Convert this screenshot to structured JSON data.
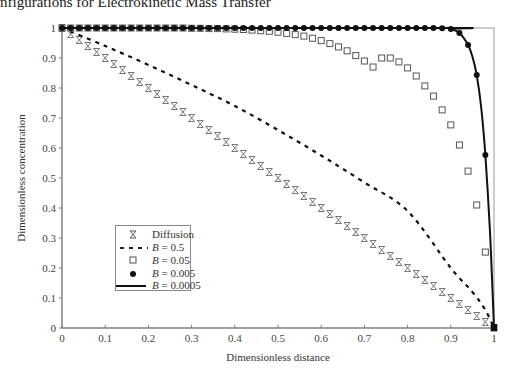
{
  "page_header": "nfigurations for Electrokinetic Mass Transfer",
  "chart_data": {
    "type": "scatter",
    "title": "",
    "xlabel": "Dimensionless distance",
    "ylabel": "Dimensionless concentration",
    "xlim": [
      0,
      1
    ],
    "ylim": [
      0,
      1
    ],
    "x_ticks": [
      "0",
      "0.1",
      "0.2",
      "0.3",
      "0.4",
      "0.5",
      "0.6",
      "0.7",
      "0.8",
      "0.9",
      "1"
    ],
    "y_ticks": [
      "0",
      "0.1",
      "0.2",
      "0.3",
      "0.4",
      "0.5",
      "0.6",
      "0.7",
      "0.8",
      "0.9",
      "1"
    ],
    "grid": false,
    "legend_position": "lower-left inside",
    "series": [
      {
        "name": "Diffusion",
        "marker": "asterisk",
        "x": [
          0.0,
          0.02,
          0.04,
          0.06,
          0.08,
          0.1,
          0.12,
          0.14,
          0.16,
          0.18,
          0.2,
          0.22,
          0.24,
          0.26,
          0.28,
          0.3,
          0.32,
          0.34,
          0.36,
          0.38,
          0.4,
          0.42,
          0.44,
          0.46,
          0.48,
          0.5,
          0.52,
          0.54,
          0.56,
          0.58,
          0.6,
          0.62,
          0.64,
          0.66,
          0.68,
          0.7,
          0.72,
          0.74,
          0.76,
          0.78,
          0.8,
          0.82,
          0.84,
          0.86,
          0.88,
          0.9,
          0.92,
          0.94,
          0.96,
          0.98
        ],
        "y": [
          1.0,
          0.98,
          0.96,
          0.94,
          0.92,
          0.9,
          0.88,
          0.86,
          0.84,
          0.82,
          0.8,
          0.78,
          0.76,
          0.74,
          0.72,
          0.7,
          0.68,
          0.66,
          0.64,
          0.62,
          0.6,
          0.58,
          0.56,
          0.54,
          0.52,
          0.5,
          0.48,
          0.46,
          0.44,
          0.42,
          0.4,
          0.38,
          0.36,
          0.34,
          0.32,
          0.3,
          0.28,
          0.26,
          0.24,
          0.22,
          0.2,
          0.18,
          0.16,
          0.14,
          0.12,
          0.1,
          0.08,
          0.06,
          0.04,
          0.02
        ]
      },
      {
        "name": "B = 0.5",
        "marker": "dashed-line",
        "x": [
          0.0,
          0.1,
          0.2,
          0.3,
          0.4,
          0.5,
          0.6,
          0.7,
          0.8,
          0.9,
          0.95,
          0.98,
          1.0
        ],
        "y": [
          1.0,
          0.94,
          0.877,
          0.81,
          0.74,
          0.66,
          0.575,
          0.485,
          0.39,
          0.2,
          0.12,
          0.06,
          0.0
        ]
      },
      {
        "name": "B = 0.05",
        "marker": "open-square",
        "x": [
          0.0,
          0.02,
          0.04,
          0.06,
          0.08,
          0.1,
          0.12,
          0.14,
          0.16,
          0.18,
          0.2,
          0.22,
          0.24,
          0.26,
          0.28,
          0.3,
          0.32,
          0.34,
          0.36,
          0.38,
          0.4,
          0.42,
          0.44,
          0.46,
          0.48,
          0.5,
          0.52,
          0.54,
          0.56,
          0.58,
          0.6,
          0.62,
          0.64,
          0.66,
          0.68,
          0.7,
          0.72,
          0.74,
          0.76,
          0.78,
          0.8,
          0.82,
          0.84,
          0.86,
          0.88,
          0.9,
          0.92,
          0.94,
          0.96,
          0.98,
          1.0
        ],
        "y": [
          1.0,
          1.0,
          1.0,
          1.0,
          1.0,
          1.0,
          1.0,
          1.0,
          1.0,
          1.0,
          1.0,
          1.0,
          1.0,
          1.0,
          1.0,
          0.999,
          0.999,
          0.998,
          0.998,
          0.997,
          0.996,
          0.995,
          0.993,
          0.991,
          0.989,
          0.986,
          0.982,
          0.978,
          0.973,
          0.966,
          0.958,
          0.948,
          0.937,
          0.924,
          0.908,
          0.89,
          0.87,
          0.9,
          0.9,
          0.887,
          0.867,
          0.84,
          0.807,
          0.773,
          0.727,
          0.677,
          0.61,
          0.523,
          0.41,
          0.253,
          0.0
        ]
      },
      {
        "name": "B = 0.005",
        "marker": "filled-circle",
        "x": [
          0.0,
          0.02,
          0.04,
          0.06,
          0.08,
          0.1,
          0.12,
          0.14,
          0.16,
          0.18,
          0.2,
          0.22,
          0.24,
          0.26,
          0.28,
          0.3,
          0.32,
          0.34,
          0.36,
          0.38,
          0.4,
          0.42,
          0.44,
          0.46,
          0.48,
          0.5,
          0.52,
          0.54,
          0.56,
          0.58,
          0.6,
          0.62,
          0.64,
          0.66,
          0.68,
          0.7,
          0.72,
          0.74,
          0.76,
          0.78,
          0.8,
          0.82,
          0.84,
          0.86,
          0.88,
          0.9,
          0.92,
          0.94,
          0.96,
          0.98,
          1.0
        ],
        "y": [
          1.0,
          1.0,
          1.0,
          1.0,
          1.0,
          1.0,
          1.0,
          1.0,
          1.0,
          1.0,
          1.0,
          1.0,
          1.0,
          1.0,
          1.0,
          1.0,
          1.0,
          1.0,
          1.0,
          1.0,
          1.0,
          1.0,
          1.0,
          1.0,
          1.0,
          1.0,
          1.0,
          1.0,
          1.0,
          1.0,
          1.0,
          1.0,
          1.0,
          1.0,
          1.0,
          1.0,
          1.0,
          1.0,
          1.0,
          1.0,
          1.0,
          1.0,
          1.0,
          1.0,
          0.999,
          0.997,
          0.983,
          0.943,
          0.843,
          0.577,
          0.0
        ]
      },
      {
        "name": "B = 0.0005",
        "marker": "solid-line",
        "x": [
          0.0,
          0.88,
          0.9,
          0.92,
          0.94,
          0.95,
          0.96,
          0.97,
          0.98,
          0.99,
          0.995,
          1.0
        ],
        "y": [
          1.0,
          1.0,
          0.997,
          0.983,
          0.943,
          0.905,
          0.843,
          0.74,
          0.577,
          0.34,
          0.18,
          0.0
        ]
      }
    ]
  },
  "legend": {
    "items": [
      {
        "label": "Diffusion"
      },
      {
        "label_var": "B",
        "label_val": " = 0.5"
      },
      {
        "label_var": "B",
        "label_val": " = 0.05"
      },
      {
        "label_var": "B",
        "label_val": " = 0.005"
      },
      {
        "label_var": "B",
        "label_val": " = 0.0005"
      }
    ]
  }
}
